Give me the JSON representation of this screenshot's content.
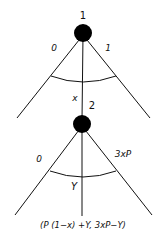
{
  "diagram": {
    "type": "game-tree",
    "nodes": [
      {
        "id": "node-1",
        "label": "1",
        "branches": {
          "left": "0",
          "right": "1"
        },
        "continuum_label": "x"
      },
      {
        "id": "node-2",
        "label": "2",
        "branches": {
          "left": "0",
          "right": "3xP"
        },
        "continuum_label": "Y"
      }
    ],
    "payoff": "(P (1−x) +Y, 3xP−Y)",
    "colors": {
      "ink": "#111111",
      "background": "#ffffff"
    }
  }
}
